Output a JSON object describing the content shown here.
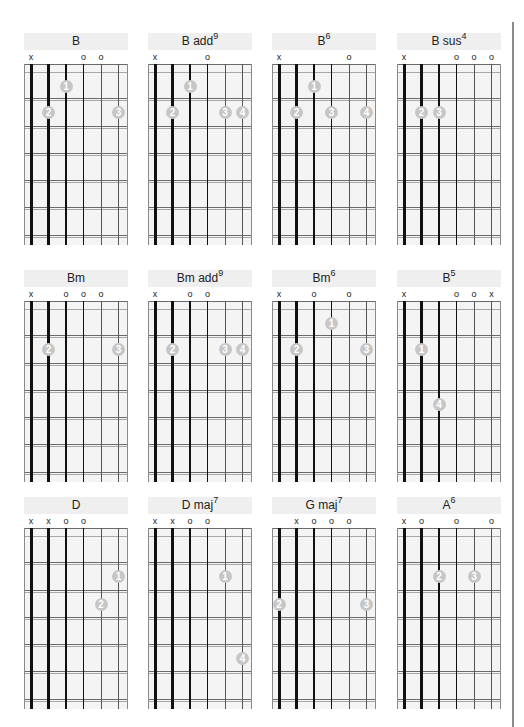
{
  "page": {
    "colors": {
      "header_bg": "#efefef",
      "board_bg": "#f4f4f4",
      "dot": "#c6c6c6",
      "string": "#111111",
      "rule": "#8c8c8c"
    }
  },
  "chords": [
    {
      "name": "B",
      "sup": "",
      "markers": {
        "6": "x",
        "3": "o",
        "2": "o"
      },
      "dots": [
        {
          "string": 4,
          "fret": 1,
          "finger": "1"
        },
        {
          "string": 5,
          "fret": 2,
          "finger": "2"
        },
        {
          "string": 1,
          "fret": 2,
          "finger": "3"
        }
      ]
    },
    {
      "name": "B add",
      "sup": "9",
      "markers": {
        "6": "x",
        "3": "o"
      },
      "dots": [
        {
          "string": 4,
          "fret": 1,
          "finger": "1"
        },
        {
          "string": 5,
          "fret": 2,
          "finger": "2"
        },
        {
          "string": 2,
          "fret": 2,
          "finger": "3"
        },
        {
          "string": 1,
          "fret": 2,
          "finger": "4"
        }
      ]
    },
    {
      "name": "B",
      "sup": "6",
      "markers": {
        "6": "x",
        "2": "o"
      },
      "dots": [
        {
          "string": 4,
          "fret": 1,
          "finger": "1"
        },
        {
          "string": 5,
          "fret": 2,
          "finger": "2"
        },
        {
          "string": 3,
          "fret": 2,
          "finger": "3"
        },
        {
          "string": 1,
          "fret": 2,
          "finger": "4"
        }
      ]
    },
    {
      "name": "B sus",
      "sup": "4",
      "markers": {
        "6": "x",
        "3": "o",
        "2": "o",
        "1": "o"
      },
      "dots": [
        {
          "string": 5,
          "fret": 2,
          "finger": "2"
        },
        {
          "string": 4,
          "fret": 2,
          "finger": "3"
        }
      ]
    },
    {
      "name": "Bm",
      "sup": "",
      "markers": {
        "6": "x",
        "4": "o",
        "3": "o",
        "2": "o"
      },
      "dots": [
        {
          "string": 5,
          "fret": 2,
          "finger": "2"
        },
        {
          "string": 1,
          "fret": 2,
          "finger": "3"
        }
      ]
    },
    {
      "name": "Bm add",
      "sup": "9",
      "markers": {
        "6": "x",
        "4": "o",
        "3": "o"
      },
      "dots": [
        {
          "string": 5,
          "fret": 2,
          "finger": "2"
        },
        {
          "string": 2,
          "fret": 2,
          "finger": "3"
        },
        {
          "string": 1,
          "fret": 2,
          "finger": "4"
        }
      ]
    },
    {
      "name": "Bm",
      "sup": "6",
      "markers": {
        "6": "x",
        "4": "o",
        "2": "o"
      },
      "dots": [
        {
          "string": 3,
          "fret": 1,
          "finger": "1"
        },
        {
          "string": 5,
          "fret": 2,
          "finger": "2"
        },
        {
          "string": 1,
          "fret": 2,
          "finger": "3"
        }
      ]
    },
    {
      "name": "B",
      "sup": "5",
      "markers": {
        "6": "x",
        "3": "o",
        "2": "o",
        "1": "x"
      },
      "dots": [
        {
          "string": 5,
          "fret": 2,
          "finger": "1"
        },
        {
          "string": 4,
          "fret": 4,
          "finger": "4"
        }
      ]
    },
    {
      "name": "D",
      "sup": "",
      "markers": {
        "6": "x",
        "5": "x",
        "4": "o",
        "3": "o"
      },
      "dots": [
        {
          "string": 1,
          "fret": 2,
          "finger": "1"
        },
        {
          "string": 2,
          "fret": 3,
          "finger": "2"
        }
      ]
    },
    {
      "name": "D maj",
      "sup": "7",
      "markers": {
        "6": "x",
        "5": "x",
        "4": "o",
        "3": "o"
      },
      "dots": [
        {
          "string": 2,
          "fret": 2,
          "finger": "1"
        },
        {
          "string": 1,
          "fret": 5,
          "finger": "4"
        }
      ]
    },
    {
      "name": "G maj",
      "sup": "7",
      "markers": {
        "5": "x",
        "4": "o",
        "3": "o",
        "2": "o"
      },
      "dots": [
        {
          "string": 6,
          "fret": 3,
          "finger": "2"
        },
        {
          "string": 1,
          "fret": 3,
          "finger": "3"
        }
      ]
    },
    {
      "name": "A",
      "sup": "6",
      "markers": {
        "6": "x",
        "5": "o",
        "3": "o",
        "1": "o"
      },
      "dots": [
        {
          "string": 4,
          "fret": 2,
          "finger": "2"
        },
        {
          "string": 2,
          "fret": 2,
          "finger": "3"
        }
      ]
    }
  ]
}
